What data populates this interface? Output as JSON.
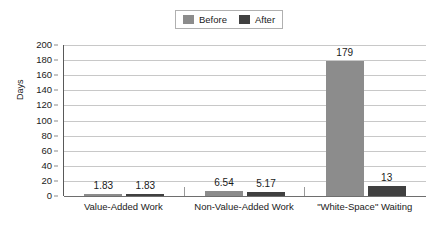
{
  "chart_data": {
    "type": "bar",
    "title": "",
    "xlabel": "",
    "ylabel": "Days",
    "ylim": [
      0,
      200
    ],
    "ytick_step": 20,
    "yticks": [
      200,
      180,
      160,
      140,
      120,
      100,
      80,
      60,
      40,
      20,
      0
    ],
    "grid": true,
    "legend_position": "top-center",
    "categories": [
      "Value-Added Work",
      "Non-Value-Added Work",
      "\"White-Space\" Waiting"
    ],
    "series": [
      {
        "name": "Before",
        "color": "#8c8c8c",
        "values": [
          1.83,
          6.54,
          179
        ],
        "labels": [
          "1.83",
          "6.54",
          "179"
        ]
      },
      {
        "name": "After",
        "color": "#404040",
        "values": [
          1.83,
          5.17,
          13
        ],
        "labels": [
          "1.83",
          "5.17",
          "13"
        ]
      }
    ]
  },
  "legend": {
    "entries": [
      {
        "label": "Before",
        "color": "#8c8c8c"
      },
      {
        "label": "After",
        "color": "#404040"
      }
    ]
  },
  "axes": {
    "y_title": "Days",
    "y_tick_labels": [
      "200",
      "180",
      "160",
      "140",
      "120",
      "100",
      "80",
      "60",
      "40",
      "20",
      "0"
    ],
    "x_tick_labels": [
      "Value-Added Work",
      "Non-Value-Added Work",
      "\"White-Space\" Waiting"
    ]
  },
  "colors": {
    "before": "#8c8c8c",
    "after": "#404040",
    "gridline": "#c8c8c8",
    "axis": "#595959",
    "text": "#1a1a1a",
    "background": "#ffffff"
  }
}
